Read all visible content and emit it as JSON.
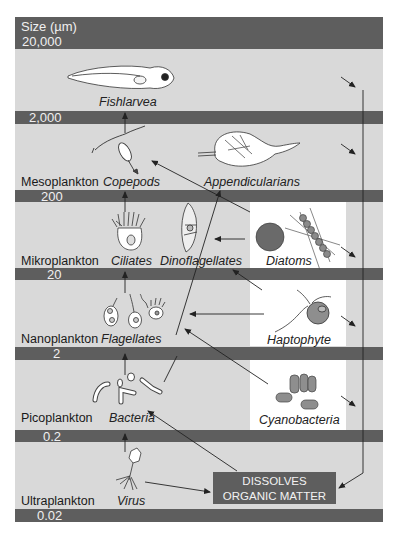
{
  "header": {
    "title": "Size (µm)",
    "top_value": "20,000"
  },
  "size_bands": [
    "2,000",
    "200",
    "20",
    "2",
    "0.2",
    "0.02"
  ],
  "size_classes": [
    "Mesoplankton",
    "Mikroplankton",
    "Nanoplankton",
    "Picoplankton",
    "Ultraplankton"
  ],
  "organisms": {
    "fishlarvae": "Fishlarvea",
    "copepods": "Copepods",
    "appendicularians": "Appendicularians",
    "ciliates": "Ciliates",
    "dinoflagellates": "Dinoflagellates",
    "diatoms": "Diatoms",
    "flagellates": "Flagellates",
    "haptophyte": "Haptophyte",
    "bacteria": "Bacteria",
    "cyanobacteria": "Cyanobacteria",
    "virus": "Virus"
  },
  "dom_box": {
    "line1": "DISSOLVES",
    "line2": "ORGANIC MATTER"
  },
  "colors": {
    "background": "#d9d9d9",
    "band": "#5e5e5e",
    "panel": "#ffffff",
    "arrow": "#222222"
  }
}
